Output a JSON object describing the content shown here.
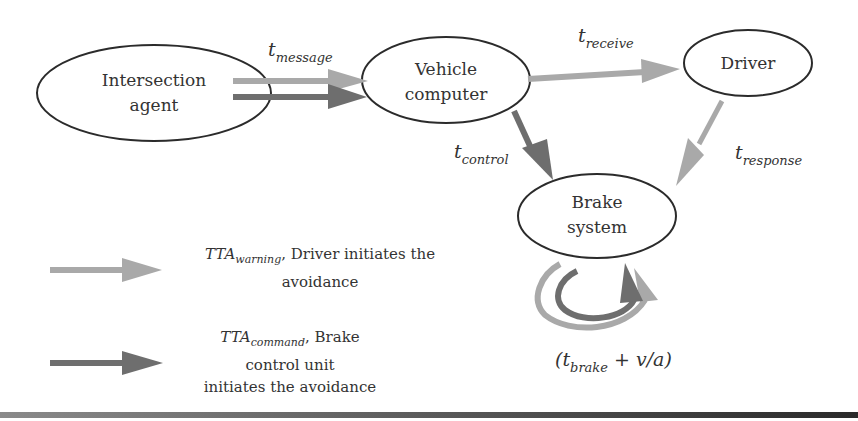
{
  "colors": {
    "warning_arrow": "#a9a9a9",
    "command_arrow": "#6e6e6e",
    "node_stroke": "#2b2b2b",
    "text": "#333333"
  },
  "nodes": {
    "intersection_agent": {
      "line1": "Intersection",
      "line2": "agent"
    },
    "vehicle_computer": {
      "line1": "Vehicle",
      "line2": "computer"
    },
    "driver": {
      "line1": "Driver"
    },
    "brake_system": {
      "line1": "Brake",
      "line2": "system"
    }
  },
  "edge_labels": {
    "message": {
      "base": "t",
      "sub": "message"
    },
    "receive": {
      "base": "t",
      "sub": "receive"
    },
    "control": {
      "base": "t",
      "sub": "control"
    },
    "response": {
      "base": "t",
      "sub": "response"
    },
    "brake": {
      "open": "(t",
      "sub": "brake",
      "rest": " + v/a)"
    }
  },
  "legend": {
    "warning": {
      "tta": "TTA",
      "sub": "warning",
      "text1": ", Driver initiates the",
      "text2": "avoidance"
    },
    "command": {
      "tta": "TTA",
      "sub": "command",
      "text1": ", Brake",
      "text2": "control unit",
      "text3": "initiates the avoidance"
    }
  }
}
